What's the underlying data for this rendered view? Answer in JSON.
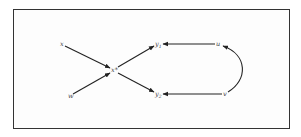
{
  "diagram": {
    "nodes": [
      {
        "id": "x",
        "label": "x",
        "pos": [
          62,
          44
        ]
      },
      {
        "id": "w",
        "label": "w",
        "pos": [
          70,
          96
        ]
      },
      {
        "id": "xstar",
        "label": "x*",
        "pos": [
          113,
          70
        ]
      },
      {
        "id": "y1",
        "label": "y",
        "sub": "1",
        "pos": [
          157,
          44
        ]
      },
      {
        "id": "y2",
        "label": "y",
        "sub": "2",
        "pos": [
          157,
          95
        ]
      },
      {
        "id": "u",
        "label": "u",
        "pos": [
          218,
          44
        ]
      },
      {
        "id": "v",
        "label": "v",
        "pos": [
          225,
          94
        ]
      }
    ],
    "edges": [
      {
        "from": "x",
        "to": "xstar"
      },
      {
        "from": "w",
        "to": "xstar"
      },
      {
        "from": "xstar",
        "to": "y1"
      },
      {
        "from": "xstar",
        "to": "y2"
      },
      {
        "from": "u",
        "to": "y1"
      },
      {
        "from": "v",
        "to": "y2"
      },
      {
        "from": "v",
        "to": "u",
        "curved": true
      }
    ],
    "colors": {
      "stroke": "#222222",
      "frame": "#333333",
      "text": "#444444"
    }
  }
}
